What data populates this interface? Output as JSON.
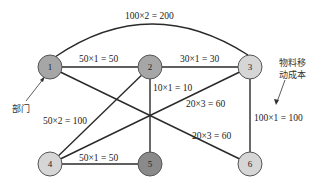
{
  "diagram": {
    "type": "network",
    "nodes": [
      {
        "id": "1",
        "label": "1",
        "x": 50,
        "y": 67,
        "fill": "#a6a6a6"
      },
      {
        "id": "2",
        "label": "2",
        "x": 150,
        "y": 67,
        "fill": "#a6a6a6"
      },
      {
        "id": "3",
        "label": "3",
        "x": 250,
        "y": 67,
        "fill": "#d6d6d6"
      },
      {
        "id": "4",
        "label": "4",
        "x": 50,
        "y": 164,
        "fill": "#d6d6d6"
      },
      {
        "id": "5",
        "label": "5",
        "x": 150,
        "y": 164,
        "fill": "#8a8a8a"
      },
      {
        "id": "6",
        "label": "6",
        "x": 250,
        "y": 164,
        "fill": "#d6d6d6"
      }
    ],
    "edges": [
      {
        "from": "1",
        "to": "3",
        "label": "100×2 = 200"
      },
      {
        "from": "1",
        "to": "2",
        "label": "50×1 = 50"
      },
      {
        "from": "2",
        "to": "3",
        "label": "30×1 = 30"
      },
      {
        "from": "2",
        "to": "5",
        "label": "10×1 = 10"
      },
      {
        "from": "4",
        "to": "2",
        "label": "50×2 = 100"
      },
      {
        "from": "4",
        "to": "3",
        "label": "20×3 = 60"
      },
      {
        "from": "1",
        "to": "6",
        "label": "20×3 = 60"
      },
      {
        "from": "3",
        "to": "6",
        "label": "100×1 = 100"
      },
      {
        "from": "4",
        "to": "5",
        "label": "50×1 = 50"
      }
    ],
    "annotations": {
      "department": "部门",
      "material_cost_line1": "物料移",
      "material_cost_line2": "动成本"
    }
  }
}
